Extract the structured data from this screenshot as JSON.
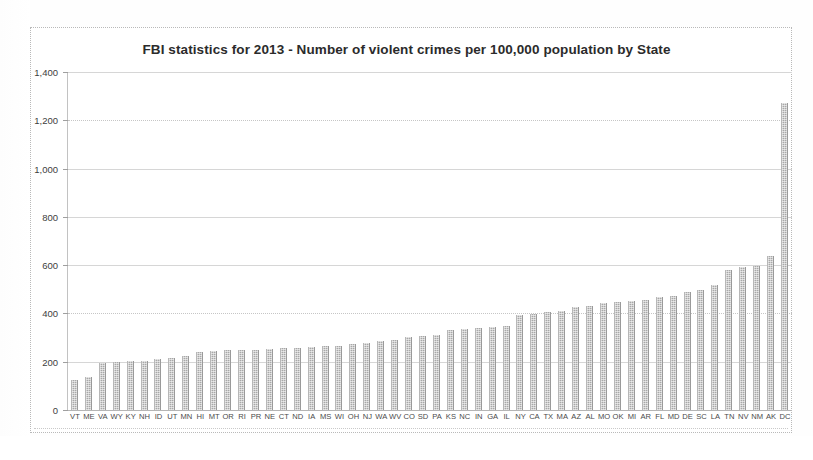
{
  "chart_data": {
    "type": "bar",
    "title": "FBI statistics for 2013 - Number of violent crimes per 100,000 population by State",
    "xlabel": "",
    "ylabel": "",
    "ylim": [
      0,
      1400
    ],
    "ytick_labels": [
      "0",
      "200",
      "400",
      "600",
      "800",
      "1,000",
      "1,200",
      "1,400"
    ],
    "ytick_values": [
      0,
      200,
      400,
      600,
      800,
      1000,
      1200,
      1400
    ],
    "grid": true,
    "legend": "none",
    "bar_color": "#a8a8a8",
    "categories": [
      "VT",
      "ME",
      "VA",
      "WY",
      "KY",
      "NH",
      "ID",
      "UT",
      "MN",
      "HI",
      "MT",
      "OR",
      "RI",
      "PR",
      "NE",
      "CT",
      "ND",
      "IA",
      "MS",
      "WI",
      "OH",
      "NJ",
      "WA",
      "WV",
      "CO",
      "SD",
      "PA",
      "KS",
      "NC",
      "IN",
      "GA",
      "IL",
      "NY",
      "CA",
      "TX",
      "MA",
      "AZ",
      "AL",
      "MO",
      "OK",
      "MI",
      "AR",
      "FL",
      "MD",
      "DE",
      "SC",
      "LA",
      "TN",
      "NV",
      "NM",
      "AK",
      "DC"
    ],
    "values": [
      125,
      135,
      196,
      199,
      201,
      203,
      213,
      216,
      224,
      239,
      245,
      247,
      248,
      250,
      253,
      255,
      258,
      263,
      265,
      267,
      274,
      278,
      285,
      290,
      302,
      307,
      311,
      331,
      335,
      339,
      344,
      348,
      394,
      396,
      406,
      411,
      428,
      430,
      443,
      449,
      451,
      456,
      469,
      471,
      489,
      497,
      518,
      578,
      591,
      598,
      640,
      1270
    ]
  },
  "axis": {
    "y_max_label": "1,400",
    "y_min_label": "0"
  }
}
